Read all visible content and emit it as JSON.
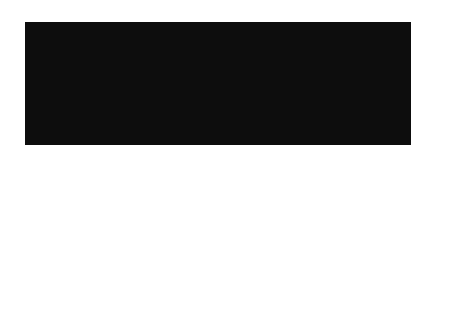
{
  "diagram": {
    "labels": {
      "earth_rotation": "Earth’s rotation",
      "north_pole": "North Pole",
      "earth": "Earth",
      "moon": "Moon",
      "moon_pull_lines": [
        "Gravitational attraction of",
        "Earth’s tidal bulge “pulls”",
        "Moon ahead in its orbit."
      ],
      "earth_drag_lines": [
        "Moon’s gravitational",
        "attraction pulls Earth’s",
        "tidal bulge “backward,”",
        "slowing Earth’s rotation."
      ]
    },
    "colors": {
      "background": "#0d0d0d",
      "arrow": "#8a8a8a",
      "text": "#e6e6e6",
      "earth": "#7a7a7a",
      "bulge": "#e8e8e0",
      "moon": "#d8d8d2"
    }
  }
}
